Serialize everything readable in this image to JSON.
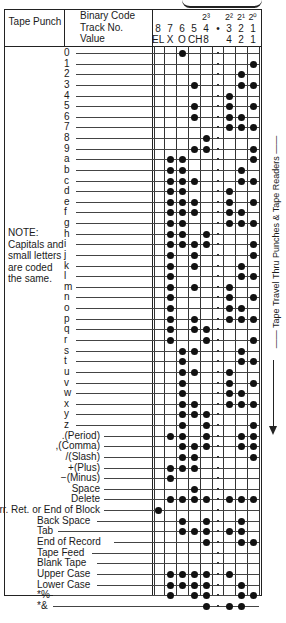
{
  "header": {
    "tape_punch": "Tape Punch",
    "binary_code_labels": [
      "Binary Code",
      "Track No.",
      "Value"
    ],
    "columns": [
      {
        "key": "c8",
        "power": "",
        "track": "8",
        "value": "EL"
      },
      {
        "key": "c7",
        "power": "",
        "track": "7",
        "value": "X"
      },
      {
        "key": "c6",
        "power": "",
        "track": "6",
        "value": "O"
      },
      {
        "key": "c5",
        "power": "",
        "track": "5",
        "value": "CH"
      },
      {
        "key": "c4",
        "power": "2³",
        "track": "4",
        "value": "8"
      },
      {
        "key": "feed",
        "power": "",
        "track": "•",
        "value": ""
      },
      {
        "key": "c3",
        "power": "2²",
        "track": "3",
        "value": "4"
      },
      {
        "key": "c2",
        "power": "2¹",
        "track": "2",
        "value": "2"
      },
      {
        "key": "c1",
        "power": "2⁰",
        "track": "1",
        "value": "1"
      }
    ]
  },
  "note": "NOTE: Capitals and small letters are coded the same.",
  "side_label": "Tape Travel Thru Punches & Tape Readers",
  "rows": [
    {
      "label": "0",
      "holes": [
        6
      ]
    },
    {
      "label": "1",
      "holes": [
        1
      ]
    },
    {
      "label": "2",
      "holes": [
        2
      ]
    },
    {
      "label": "3",
      "holes": [
        5,
        2,
        1
      ]
    },
    {
      "label": "4",
      "holes": [
        3
      ]
    },
    {
      "label": "5",
      "holes": [
        5,
        3,
        1
      ]
    },
    {
      "label": "6",
      "holes": [
        5,
        3,
        2
      ]
    },
    {
      "label": "7",
      "holes": [
        3,
        2,
        1
      ]
    },
    {
      "label": "8",
      "holes": [
        4
      ]
    },
    {
      "label": "9",
      "holes": [
        5,
        4,
        1
      ]
    },
    {
      "label": "a",
      "holes": [
        7,
        6,
        1
      ]
    },
    {
      "label": "b",
      "holes": [
        7,
        6,
        2
      ]
    },
    {
      "label": "c",
      "holes": [
        7,
        6,
        5,
        2,
        1
      ]
    },
    {
      "label": "d",
      "holes": [
        7,
        6,
        3
      ]
    },
    {
      "label": "e",
      "holes": [
        7,
        6,
        5,
        3,
        1
      ]
    },
    {
      "label": "f",
      "holes": [
        7,
        6,
        5,
        3,
        2
      ]
    },
    {
      "label": "g",
      "holes": [
        7,
        6,
        3,
        2,
        1
      ]
    },
    {
      "label": "h",
      "holes": [
        7,
        6,
        4
      ]
    },
    {
      "label": "i",
      "holes": [
        7,
        6,
        5,
        4,
        1
      ]
    },
    {
      "label": "j",
      "holes": [
        7,
        5,
        1
      ]
    },
    {
      "label": "k",
      "holes": [
        7,
        5,
        2
      ]
    },
    {
      "label": "l",
      "holes": [
        7,
        2,
        1
      ]
    },
    {
      "label": "m",
      "holes": [
        7,
        5,
        3
      ]
    },
    {
      "label": "n",
      "holes": [
        7,
        3,
        1
      ]
    },
    {
      "label": "o",
      "holes": [
        7,
        3,
        2
      ]
    },
    {
      "label": "p",
      "holes": [
        7,
        5,
        3,
        2,
        1
      ]
    },
    {
      "label": "q",
      "holes": [
        7,
        5,
        4
      ]
    },
    {
      "label": "r",
      "holes": [
        7,
        4,
        1
      ]
    },
    {
      "label": "s",
      "holes": [
        6,
        5,
        2
      ]
    },
    {
      "label": "t",
      "holes": [
        6,
        2,
        1
      ]
    },
    {
      "label": "u",
      "holes": [
        6,
        5,
        3
      ]
    },
    {
      "label": "v",
      "holes": [
        6,
        3,
        1
      ]
    },
    {
      "label": "w",
      "holes": [
        6,
        3,
        2
      ]
    },
    {
      "label": "x",
      "holes": [
        6,
        5,
        3,
        2,
        1
      ]
    },
    {
      "label": "y",
      "holes": [
        6,
        5,
        4
      ]
    },
    {
      "label": "z",
      "holes": [
        6,
        4,
        1
      ]
    },
    {
      "label": ".(Period)",
      "holes": [
        7,
        6,
        4,
        2,
        1
      ]
    },
    {
      "label": ",(Comma)",
      "holes": [
        6,
        5,
        4,
        2,
        1
      ]
    },
    {
      "label": "/(Slash)",
      "holes": [
        6,
        5,
        1
      ]
    },
    {
      "label": "+(Plus)",
      "holes": [
        7,
        6,
        5
      ]
    },
    {
      "label": "−(Minus)",
      "holes": [
        7
      ]
    },
    {
      "label": "Space",
      "holes": [
        5
      ]
    },
    {
      "label": "Delete",
      "holes": [
        7,
        6,
        5,
        4,
        3,
        2,
        1
      ]
    },
    {
      "label": "Carr. Ret. or End of Block",
      "holes": [
        8
      ]
    },
    {
      "label": "Back Space",
      "holes": [
        6,
        4,
        2
      ]
    },
    {
      "label": "Tab",
      "holes": [
        6,
        5,
        4,
        3,
        2
      ]
    },
    {
      "label": "End of Record",
      "holes": [
        4,
        2,
        1
      ]
    },
    {
      "label": "Tape Feed",
      "holes": []
    },
    {
      "label": "Blank Tape",
      "holes": []
    },
    {
      "label": "Upper Case",
      "holes": [
        7,
        6,
        5,
        4,
        3
      ]
    },
    {
      "label": "Lower Case",
      "holes": [
        7,
        6,
        5,
        4,
        2
      ]
    },
    {
      "label": "*%",
      "holes": [
        7,
        5,
        4,
        2,
        1
      ]
    },
    {
      "label": "*&",
      "holes": [
        4,
        3,
        2
      ]
    }
  ]
}
